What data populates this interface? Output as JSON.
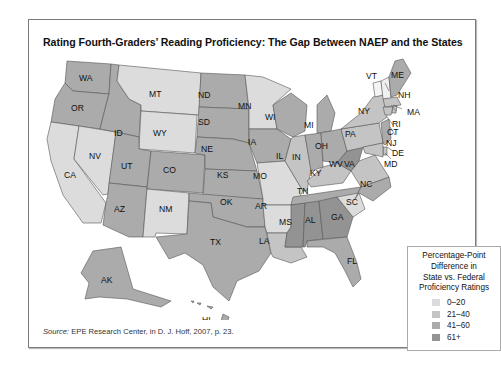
{
  "title": "Rating Fourth-Graders’ Reading Proficiency: The Gap Between NAEP and the States",
  "legend": {
    "title_lines": [
      "Percentage-Point",
      "Difference in",
      "State vs. Federal",
      "Proficiency Ratings"
    ],
    "items": [
      {
        "label": "0–20",
        "color": "#dcdcdc"
      },
      {
        "label": "21–40",
        "color": "#c4c4c4"
      },
      {
        "label": "41–60",
        "color": "#ababab"
      },
      {
        "label": "61+",
        "color": "#939393"
      }
    ]
  },
  "source": {
    "prefix": "Source:",
    "text": " EPE Research Center, in D. J. Hoff, 2007, p. 23."
  },
  "states": [
    {
      "abbr": "WA",
      "band": "41–60"
    },
    {
      "abbr": "OR",
      "band": "41–60"
    },
    {
      "abbr": "CA",
      "band": "0–20"
    },
    {
      "abbr": "NV",
      "band": "0–20"
    },
    {
      "abbr": "ID",
      "band": "41–60"
    },
    {
      "abbr": "MT",
      "band": "0–20"
    },
    {
      "abbr": "WY",
      "band": "0–20"
    },
    {
      "abbr": "UT",
      "band": "41–60"
    },
    {
      "abbr": "CO",
      "band": "41–60"
    },
    {
      "abbr": "AZ",
      "band": "41–60"
    },
    {
      "abbr": "NM",
      "band": "0–20"
    },
    {
      "abbr": "ND",
      "band": "41–60"
    },
    {
      "abbr": "SD",
      "band": "41–60"
    },
    {
      "abbr": "NE",
      "band": "41–60"
    },
    {
      "abbr": "KS",
      "band": "41–60"
    },
    {
      "abbr": "OK",
      "band": "41–60"
    },
    {
      "abbr": "TX",
      "band": "41–60"
    },
    {
      "abbr": "MN",
      "band": "0–20"
    },
    {
      "abbr": "IA",
      "band": "41–60"
    },
    {
      "abbr": "MO",
      "band": "0–20"
    },
    {
      "abbr": "AR",
      "band": "0–20"
    },
    {
      "abbr": "LA",
      "band": "21–40"
    },
    {
      "abbr": "WI",
      "band": "41–60"
    },
    {
      "abbr": "IL",
      "band": "21–40"
    },
    {
      "abbr": "MI",
      "band": "41–60"
    },
    {
      "abbr": "IN",
      "band": "41–60"
    },
    {
      "abbr": "OH",
      "band": "41–60"
    },
    {
      "abbr": "KY",
      "band": "21–40"
    },
    {
      "abbr": "TN",
      "band": "41–60"
    },
    {
      "abbr": "MS",
      "band": "61+"
    },
    {
      "abbr": "AL",
      "band": "61+"
    },
    {
      "abbr": "GA",
      "band": "61+"
    },
    {
      "abbr": "FL",
      "band": "41–60"
    },
    {
      "abbr": "SC",
      "band": "0–20"
    },
    {
      "abbr": "NC",
      "band": "41–60"
    },
    {
      "abbr": "VA",
      "band": "21–40"
    },
    {
      "abbr": "WV",
      "band": "61+"
    },
    {
      "abbr": "PA",
      "band": "21–40"
    },
    {
      "abbr": "NY",
      "band": "21–40"
    },
    {
      "abbr": "VT",
      "band": "0–20"
    },
    {
      "abbr": "NH",
      "band": "0–20"
    },
    {
      "abbr": "ME",
      "band": "41–60"
    },
    {
      "abbr": "MA",
      "band": "21–40"
    },
    {
      "abbr": "RI",
      "band": "21–40"
    },
    {
      "abbr": "CT",
      "band": "21–40"
    },
    {
      "abbr": "NJ",
      "band": "41–60"
    },
    {
      "abbr": "DE",
      "band": "21–40"
    },
    {
      "abbr": "MD",
      "band": "21–40"
    },
    {
      "abbr": "AK",
      "band": "41–60"
    },
    {
      "abbr": "HI",
      "band": "41–60"
    }
  ]
}
